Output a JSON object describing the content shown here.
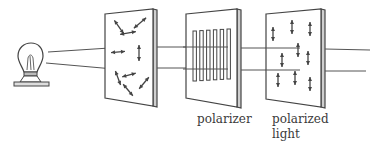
{
  "figure": {
    "labels": {
      "polarizer": "polarizer",
      "polarized_line1": "polarized",
      "polarized_line2": "light"
    },
    "elements": {
      "source": "light-bulb",
      "unpolarized_panel": "randomly oriented double arrows",
      "polarizer_panel": "vertical slots",
      "polarized_panel": "vertical double arrows"
    },
    "polarizer_slot_count": 6,
    "unpolarized_arrow_angles_deg": [
      -55,
      40,
      10,
      5,
      90,
      -70,
      15,
      -50,
      50,
      0
    ],
    "polarized_arrow_count": 10,
    "colors": {
      "ink": "#444444",
      "background": "#ffffff"
    }
  }
}
